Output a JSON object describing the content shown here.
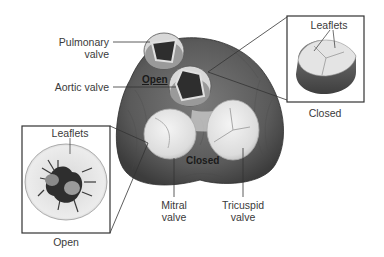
{
  "diagram": {
    "labels": {
      "pulmonary_valve": [
        "Pulmonary",
        "valve"
      ],
      "aortic_valve": "Aortic valve",
      "mitral_valve": [
        "Mitral",
        "valve"
      ],
      "tricuspid_valve": [
        "Tricuspid",
        "valve"
      ],
      "open_state": "Open",
      "closed_state": "Closed"
    },
    "inset_closed": {
      "leaflets_label": "Leaflets",
      "caption": "Closed"
    },
    "inset_open": {
      "leaflets_label": "Leaflets",
      "caption": "Open"
    },
    "colors": {
      "muscle": "#5a5a5a",
      "muscle_dark": "#3c3c3c",
      "valve_light": "#e6e6e6",
      "valve_opening": "#2e2e2e",
      "line": "#333333"
    }
  }
}
